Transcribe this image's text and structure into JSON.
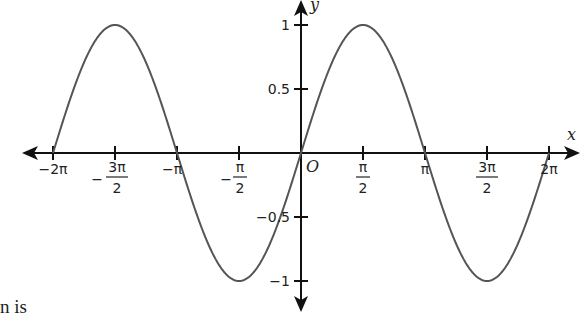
{
  "chart_data": {
    "type": "line",
    "title": "",
    "function": "y = sin x",
    "xlabel": "x",
    "ylabel": "y",
    "origin_label": "O",
    "xlim": [
      -6.2832,
      6.2832
    ],
    "ylim": [
      -1,
      1
    ],
    "grid": false,
    "legend": null,
    "x_ticks": [
      "-2π",
      "-3π/2",
      "-π",
      "-π/2",
      "π/2",
      "π",
      "3π/2",
      "2π"
    ],
    "y_ticks": [
      "1",
      "0.5",
      "-0.5",
      "-1"
    ],
    "series": [
      {
        "name": "sin x",
        "x": [
          "-2π",
          "-3π/2",
          "-π",
          "-π/2",
          "0",
          "π/2",
          "π",
          "3π/2",
          "2π"
        ],
        "values": [
          0,
          1,
          0,
          -1,
          0,
          1,
          0,
          -1,
          0
        ]
      }
    ]
  },
  "labels": {
    "x_axis": "x",
    "y_axis": "y",
    "origin": "O",
    "xt": {
      "m2pi": "−2π",
      "m3pi2_num": "3π",
      "m3pi2_den": "2",
      "mpi": "−π",
      "mpi2_num": "π",
      "mpi2_den": "2",
      "pi2_num": "π",
      "pi2_den": "2",
      "pi": "π",
      "p3pi2_num": "3π",
      "p3pi2_den": "2",
      "p2pi": "2π"
    },
    "yt": {
      "one": "1",
      "half": "0.5",
      "mhalf": "−0.5",
      "mone": "−1"
    }
  },
  "text_fragment": "n is",
  "colors": {
    "axis": "#111111",
    "curve": "#555555"
  }
}
